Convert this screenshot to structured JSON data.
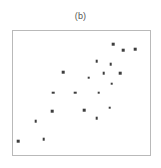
{
  "figure": {
    "caption": "(b)",
    "frame_color": "#b9b9b9",
    "background": "#ffffff",
    "marker_color": "#3d3d3d"
  },
  "chart_data": {
    "type": "scatter",
    "title": "(b)",
    "xlabel": "",
    "ylabel": "",
    "xlim": [
      0,
      100
    ],
    "ylim": [
      0,
      100
    ],
    "grid": false,
    "legend": null,
    "tick_labels_x": [],
    "tick_labels_y": [],
    "marker": "square",
    "series": [
      {
        "name": "points",
        "x": [
          73.0,
          89.2,
          61.2,
          71.2,
          36.7,
          66.2,
          78.4,
          55.4,
          72.0,
          29.5,
          45.3,
          62.6,
          28.8,
          70.5,
          51.8,
          16.5,
          61.2,
          22.3,
          3.6,
          80.6
        ],
        "y": [
          89.3,
          85.3,
          75.7,
          73.3,
          67.0,
          66.2,
          66.2,
          62.2,
          57.4,
          50.2,
          50.2,
          50.2,
          35.1,
          38.3,
          35.9,
          27.1,
          29.5,
          12.7,
          11.1,
          84.5
        ]
      }
    ],
    "n_points": 20
  }
}
